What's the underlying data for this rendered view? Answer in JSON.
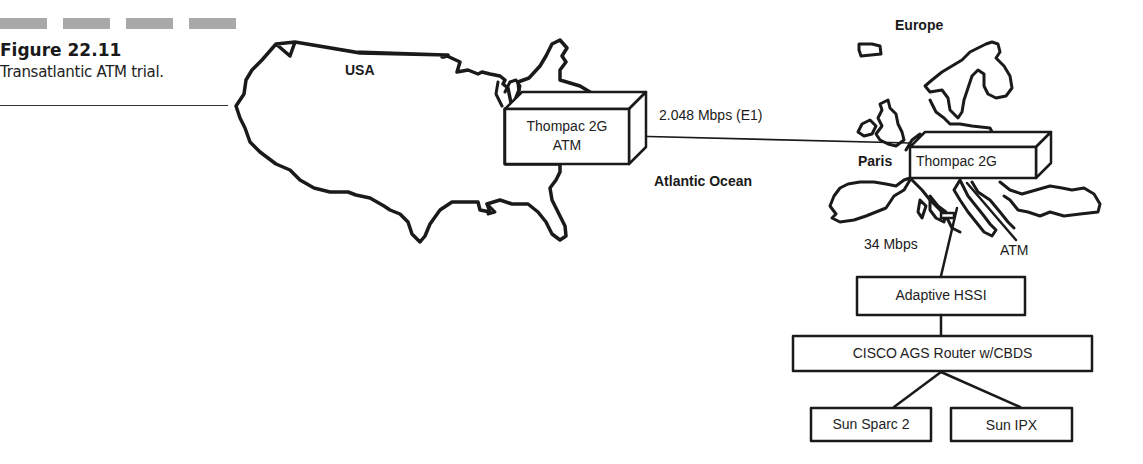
{
  "caption": {
    "figure_number": "Figure 22.11",
    "title": "Transatlantic ATM trial."
  },
  "map_labels": {
    "usa": "USA",
    "europe": "Europe",
    "paris": "Paris",
    "ocean": "Atlantic Ocean"
  },
  "links": {
    "transatlantic": "2.048 Mbps (E1)",
    "access": "34 Mbps",
    "atm": "ATM"
  },
  "nodes": {
    "us_switch": {
      "line1": "Thompac 2G",
      "line2": "ATM"
    },
    "eu_switch": {
      "line1": "Thompac 2G"
    },
    "hssi": "Adaptive HSSI",
    "router": "CISCO AGS Router w/CBDS",
    "host1": "Sun Sparc 2",
    "host2": "Sun IPX"
  },
  "colors": {
    "ink": "#1a1a1a",
    "caption_bars": "#a9a9a9",
    "background": "#ffffff"
  }
}
